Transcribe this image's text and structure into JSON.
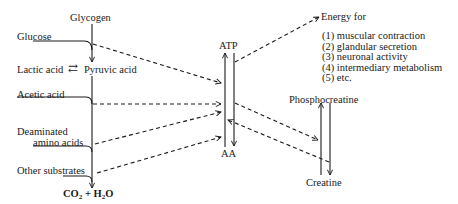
{
  "diagram": {
    "nodes": {
      "glycogen": "Glycogen",
      "glucose": "Glucose",
      "lactic_acid": "Lactic acid",
      "equilibrium_arrow": "⇄",
      "pyruvic_acid": "Pyruvic acid",
      "acetic_acid": "Acetic acid",
      "deaminated_line1": "Deaminated",
      "deaminated_line2": "amino acids",
      "other_substrates": "Other substrates",
      "end_product_co2": "CO",
      "end_product_co2_sub": "2",
      "end_product_plus": " + H",
      "end_product_h2o_sub": "2",
      "end_product_o": "O",
      "atp": "ATP",
      "aa": "AA",
      "phosphocreatine": "Phosphocreatine",
      "creatine": "Creatine",
      "energy_for": "Energy for"
    },
    "energy_uses": [
      "(1) muscular contraction",
      "(2) glandular secretion",
      "(3) neuronal activity",
      "(4) intermediary metabolism",
      "(5) etc."
    ],
    "colors": {
      "ink": "#1a1a1a",
      "background": "#ffffff"
    }
  }
}
